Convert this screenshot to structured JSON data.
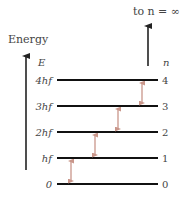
{
  "title_top": "to n = ∞",
  "axis_label": "Energy",
  "energy_symbol": "E",
  "n_symbol": "n",
  "levels": [
    {
      "n": "0",
      "energy": "0"
    },
    {
      "n": "1",
      "energy": "hf"
    },
    {
      "n": "2",
      "energy": "2hf"
    },
    {
      "n": "3",
      "energy": "3hf"
    },
    {
      "n": "4",
      "energy": "4hf"
    }
  ],
  "transitions": [
    [
      0,
      1
    ],
    [
      1,
      2
    ],
    [
      2,
      3
    ],
    [
      3,
      4
    ]
  ],
  "colors": {
    "level": "#111111",
    "transition": "#c9968a",
    "axis": "#222222"
  }
}
